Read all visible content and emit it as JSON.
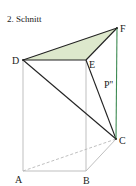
{
  "title": "2. Schnitt",
  "colors": {
    "fill": "#dde8cc",
    "edge_light": "#b8b8b8",
    "edge_dark": "#222222",
    "edge_green": "#3d8a52"
  },
  "vertices": {
    "A": {
      "label": "A",
      "x": 23,
      "y": 171
    },
    "B": {
      "label": "B",
      "x": 86,
      "y": 171
    },
    "C": {
      "label": "C",
      "x": 116,
      "y": 139
    },
    "D": {
      "label": "D",
      "x": 23,
      "y": 60
    },
    "E": {
      "label": "E",
      "x": 86,
      "y": 60
    },
    "F": {
      "label": "F",
      "x": 117,
      "y": 28
    }
  },
  "segment_label": "P''"
}
